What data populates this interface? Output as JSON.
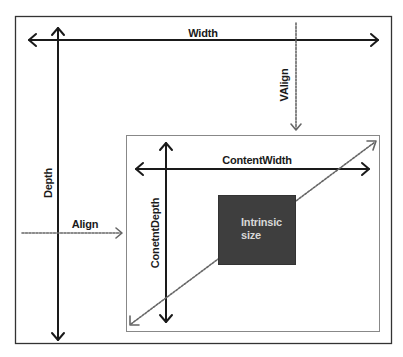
{
  "diagram": {
    "type": "layout-sizing",
    "colors": {
      "background": "#ffffff",
      "line": "#1a1a1a",
      "dashed": "#666666",
      "outer_border": "#333333",
      "inner_border": "#888888",
      "intrinsic_fill": "#3e3e3e",
      "intrinsic_text": "#d8d8d8"
    },
    "labels": {
      "width": "Width",
      "depth": "Depth",
      "valign": "VAlign",
      "align": "Align",
      "content_width": "ContentWidth",
      "content_depth": "ConetntDepth",
      "intrinsic": "Intrinsic\nsize"
    },
    "nodes": [
      {
        "id": "outer",
        "label": "",
        "kind": "container"
      },
      {
        "id": "content",
        "label": "",
        "kind": "container"
      },
      {
        "id": "intrinsic",
        "label": "Intrinsic size",
        "kind": "filled-box"
      }
    ],
    "edges": [
      {
        "id": "width",
        "label": "Width",
        "style": "solid",
        "direction": "both",
        "orientation": "horizontal"
      },
      {
        "id": "depth",
        "label": "Depth",
        "style": "solid",
        "direction": "both",
        "orientation": "vertical"
      },
      {
        "id": "valign",
        "label": "VAlign",
        "style": "dashed",
        "direction": "down",
        "target": "content"
      },
      {
        "id": "align",
        "label": "Align",
        "style": "dashed",
        "direction": "right",
        "target": "content"
      },
      {
        "id": "content_width",
        "label": "ContentWidth",
        "style": "solid",
        "direction": "both",
        "orientation": "horizontal"
      },
      {
        "id": "content_depth",
        "label": "ConetntDepth",
        "style": "solid",
        "direction": "both",
        "orientation": "vertical"
      },
      {
        "id": "diagonal",
        "label": "",
        "style": "dashed",
        "direction": "both",
        "through": "intrinsic"
      }
    ]
  }
}
